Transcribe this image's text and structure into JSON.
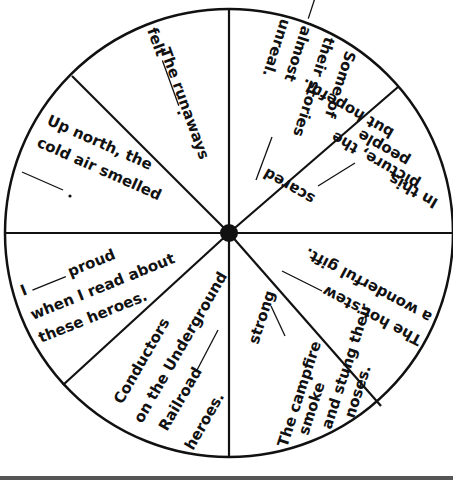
{
  "worksheet": {
    "title": "Sentence completion spinner wheel",
    "segments": [
      {
        "id": "runaways",
        "lines": [
          "The runaways",
          "felt ____ ."
        ]
      },
      {
        "id": "stories",
        "lines": [
          "Some of",
          "their stories",
          "____ almost",
          "unreal."
        ]
      },
      {
        "id": "picture",
        "lines": [
          "In this",
          "picture, the",
          "people ____ scared",
          "but hopeful."
        ]
      },
      {
        "id": "stew",
        "lines": [
          "The hot stew ____",
          "a wonderful gift."
        ]
      },
      {
        "id": "campfire",
        "lines": [
          "The campfire",
          "smoke ____ strong",
          "and stung their",
          "noses."
        ]
      },
      {
        "id": "conductors",
        "lines": [
          "Conductors",
          "on the Underground",
          "Railroad ____",
          "heroes."
        ]
      },
      {
        "id": "proud",
        "lines": [
          "I ____ proud",
          "when I read about",
          "these heroes."
        ]
      },
      {
        "id": "north",
        "lines": [
          "Up north, the",
          "cold air smelled",
          "____ ."
        ]
      }
    ]
  }
}
